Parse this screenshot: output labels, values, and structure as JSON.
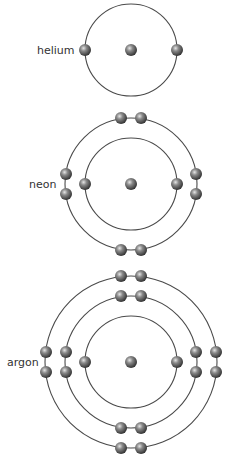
{
  "colors": {
    "ring": "#4a4a4a",
    "label": "#333333",
    "particle_light": "#d9d9d9",
    "particle_mid": "#7a7a7a",
    "particle_dark": "#2e2e2e"
  },
  "atoms": [
    {
      "name": "helium",
      "label": "helium",
      "center": [
        131,
        50
      ],
      "label_pos": [
        37,
        54
      ],
      "shells": [
        {
          "radius": 46,
          "electrons": 2
        }
      ]
    },
    {
      "name": "neon",
      "label": "neon",
      "center": [
        131,
        184
      ],
      "label_pos": [
        29,
        188
      ],
      "shells": [
        {
          "radius": 46,
          "electrons": 2
        },
        {
          "radius": 66,
          "electrons": 8
        }
      ]
    },
    {
      "name": "argon",
      "label": "argon",
      "center": [
        131,
        362
      ],
      "label_pos": [
        7,
        366
      ],
      "shells": [
        {
          "radius": 46,
          "electrons": 2
        },
        {
          "radius": 66,
          "electrons": 8
        },
        {
          "radius": 86,
          "electrons": 8
        }
      ]
    }
  ]
}
